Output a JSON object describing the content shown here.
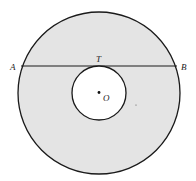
{
  "diagram": {
    "colors": {
      "shade": "#e4e4e4",
      "stroke": "#1a1a1a",
      "inner_fill": "#ffffff"
    },
    "outer_circle": {
      "cx": 99,
      "cy": 93,
      "r": 81
    },
    "inner_circle": {
      "cx": 99,
      "cy": 93,
      "r": 27
    },
    "chord": {
      "x1": 21,
      "y1": 66,
      "x2": 177,
      "y2": 66
    },
    "labels": {
      "A": "A",
      "B": "B",
      "T": "T",
      "O": "O"
    }
  }
}
